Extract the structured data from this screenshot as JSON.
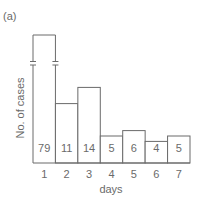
{
  "chart_data": {
    "type": "bar",
    "panel_label": "(a)",
    "title": "",
    "xlabel": "days",
    "ylabel": "No. of cases",
    "categories": [
      "1",
      "2",
      "3",
      "4",
      "5",
      "6",
      "7"
    ],
    "values": [
      79,
      11,
      14,
      5,
      6,
      4,
      5
    ],
    "data_labels": [
      "79",
      "11",
      "14",
      "5",
      "6",
      "4",
      "5"
    ],
    "broken_bars": [
      "1"
    ],
    "ylim": [
      0,
      14
    ],
    "grid": false,
    "y_ticks_shown": false,
    "legend": "none"
  }
}
